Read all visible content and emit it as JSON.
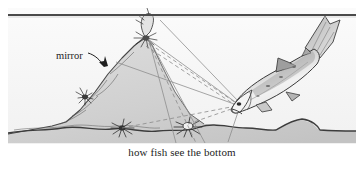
{
  "figure": {
    "caption": "how fish see the bottom",
    "label_mirror": "mirror",
    "scene": "underwater side view of lake bottom slope with light rays"
  },
  "colors": {
    "water": "#f7f7f7",
    "substrate": "#d2d2d2",
    "substrate_shade": "#bdbdbd",
    "outline": "#3a3a3a",
    "surface_line": "#4a4a4a",
    "ray_solid": "#8b8b8b",
    "ray_dashed": "#8b8b8b",
    "fish_body": "#efefef",
    "fish_dark": "#9a9a9a",
    "text": "#1d1d1d",
    "page": "#ffffff"
  },
  "geometry": {
    "surface_y": 15,
    "bottom_y": 132,
    "peak": {
      "x": 146,
      "y": 36
    },
    "fish_eye": {
      "x": 238,
      "y": 104
    },
    "rays_solid": 4,
    "rays_dashed": 4
  }
}
